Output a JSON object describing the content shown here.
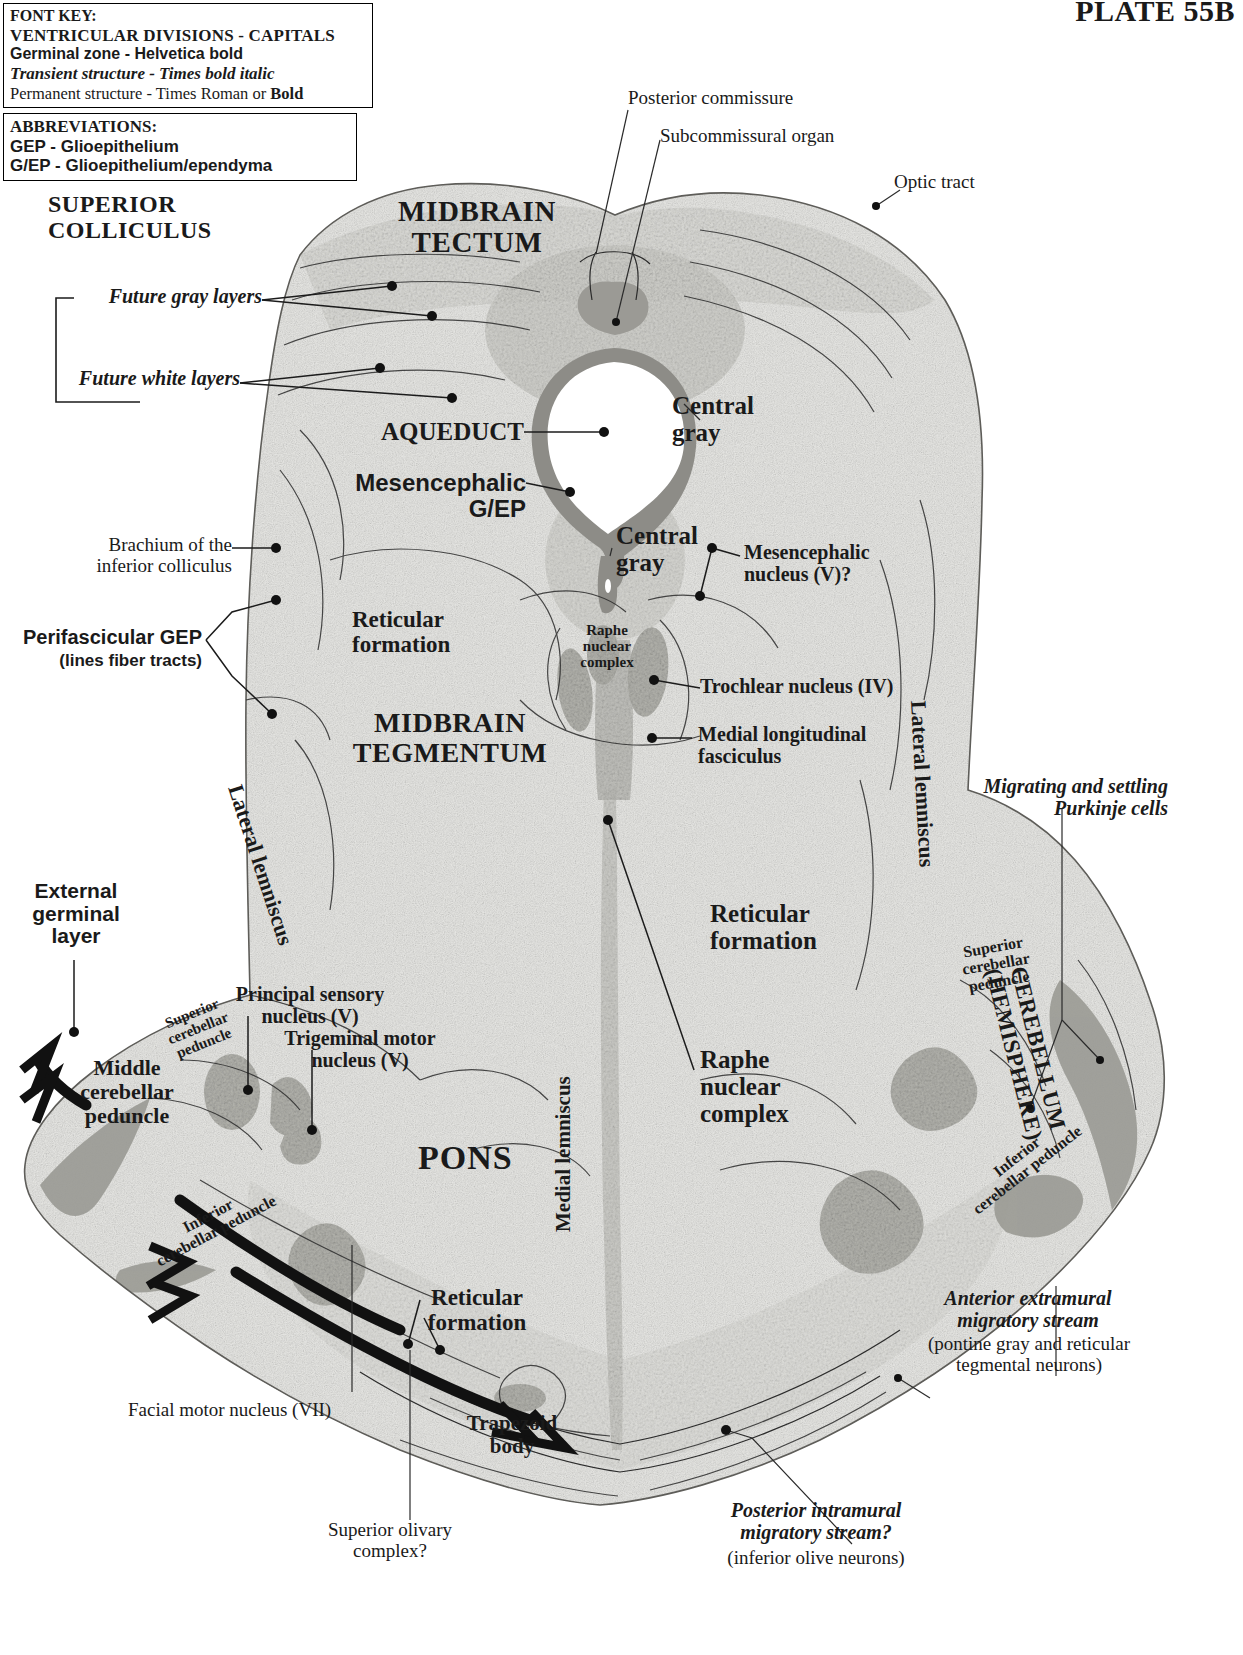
{
  "plate": {
    "number": "PLATE 55B"
  },
  "font_key": {
    "title": "FONT KEY:",
    "lines": [
      "VENTRICULAR DIVISIONS  -  CAPITALS",
      "Germinal zone - Helvetica bold",
      "Transient structure - Times bold italic",
      "Permanent structure - Times Roman or "
    ],
    "perm_bold_tail": "Bold"
  },
  "abbreviations": {
    "title": "ABBREVIATIONS:",
    "items": [
      "GEP - Glioepithelium",
      "G/EP - Glioepithelium/ependyma"
    ]
  },
  "labels": {
    "superior_colliculus": "SUPERIOR\nCOLLICULUS",
    "future_gray_layers": "Future gray layers",
    "future_white_layers": "Future white layers",
    "midbrain_tectum": "MIDBRAIN\nTECTUM",
    "posterior_commissure": "Posterior commissure",
    "subcommissural_organ": "Subcommissural organ",
    "optic_tract": "Optic tract",
    "aqueduct": "AQUEDUCT",
    "central_gray_upper": "Central\ngray",
    "central_gray_lower": "Central\ngray",
    "mesencephalic_gep": "Mesencephalic\nG/EP",
    "mesencephalic_nucleus_v": "Mesencephalic\nnucleus (V)?",
    "brachium_inferior_colliculus": "Brachium of the\ninferior colliculus",
    "perifascicular_gep": "Perifascicular GEP",
    "perifascicular_gep_sub": "(lines fiber tracts)",
    "reticular_formation_mid": "Reticular\nformation",
    "midbrain_tegmentum": "MIDBRAIN\nTEGMENTUM",
    "raphe_nuclear_complex_small": "Raphe\nnuclear\ncomplex",
    "trochlear_nucleus_iv": "Trochlear nucleus (IV)",
    "medial_longitudinal_fasciculus": "Medial longitudinal\nfasciculus",
    "lateral_lemniscus_left": "Lateral lemniscus",
    "lateral_lemniscus_right": "Lateral lemniscus",
    "migrating_purkinje": "Migrating and settling\nPurkinje cells",
    "reticular_formation_pons": "Reticular\nformation",
    "external_germinal_layer": "External\ngerminal\nlayer",
    "superior_cerebellar_peduncle_left": "Superior\ncerebellar\npeduncle",
    "superior_cerebellar_peduncle_right": "Superior\ncerebellar\npeduncle",
    "principal_sensory_nucleus_v": "Principal sensory\nnucleus (V)",
    "trigeminal_motor_nucleus_v": "Trigeminal motor\nnucleus (V)",
    "middle_cerebellar_peduncle": "Middle\ncerebellar\npeduncle",
    "cerebellum_hemisphere": "CEREBELLUM\n(HEMISPHERE)",
    "raphe_nuclear_complex_big": "Raphe\nnuclear\ncomplex",
    "pons": "PONS",
    "inferior_cerebellar_peduncle_left": "Inferior\ncerebellar peduncle",
    "inferior_cerebellar_peduncle_right": "Inferior\ncerebellar peduncle",
    "reticular_formation_lower": "Reticular\nformation",
    "medial_lemniscus": "Medial lemniscus",
    "facial_motor_nucleus_vii": "Facial motor nucleus (VII)",
    "trapezoid_body": "Trapezoid\nbody",
    "superior_olivary_complex": "Superior olivary\ncomplex?",
    "anterior_extramural_stream": "Anterior extramural\nmigratory stream",
    "anterior_extramural_stream_sub": "(pontine gray and reticular\ntegmental neurons)",
    "posterior_intramural_stream": "Posterior intramural\nmigratory stream?",
    "posterior_intramural_stream_sub": "(inferior olive neurons)"
  },
  "colors": {
    "ink": "#1a1a1a",
    "tissue_light": "#ededea",
    "tissue_mid": "#d8d7d2",
    "tissue_dark": "#a9a8a2",
    "gep_dark": "#8a8984",
    "contour": "#6d6c68",
    "background": "#ffffff"
  }
}
